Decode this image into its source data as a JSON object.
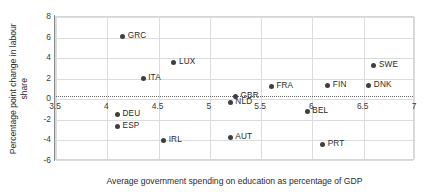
{
  "chart_data": {
    "type": "scatter",
    "title": "",
    "xlabel": "Average government spending on education as percentage of GDP",
    "ylabel": "Percentage point change in labour share",
    "xlim": [
      3.5,
      7
    ],
    "ylim": [
      -6,
      8
    ],
    "xticks": [
      "3.5",
      "4",
      "4.5",
      "5",
      "5.5",
      "6",
      "6.5",
      "7"
    ],
    "xtick_values": [
      3.5,
      4,
      4.5,
      5,
      5.5,
      6,
      6.5,
      7
    ],
    "yticks": [
      "8",
      "6",
      "4",
      "2",
      "0",
      "-2",
      "-4",
      "-6"
    ],
    "ytick_values": [
      8,
      6,
      4,
      2,
      0,
      -2,
      -4,
      -6
    ],
    "grid": true,
    "legend": "none",
    "point_color": "#3f3f3f",
    "trendline": {
      "style": "dotted",
      "color": "#6a6a6a",
      "y_value": 0.35,
      "description": "near-horizontal dotted fit line just above zero"
    },
    "points": [
      {
        "label": "GRC",
        "x": 4.15,
        "y": 6.1
      },
      {
        "label": "LUX",
        "x": 4.65,
        "y": 3.6
      },
      {
        "label": "SWE",
        "x": 6.6,
        "y": 3.3
      },
      {
        "label": "ITA",
        "x": 4.35,
        "y": 2.0
      },
      {
        "label": "FIN",
        "x": 6.15,
        "y": 1.3
      },
      {
        "label": "DNK",
        "x": 6.55,
        "y": 1.3
      },
      {
        "label": "FRA",
        "x": 5.6,
        "y": 1.2
      },
      {
        "label": "GBR",
        "x": 5.25,
        "y": 0.3
      },
      {
        "label": "NLD",
        "x": 5.2,
        "y": -0.3
      },
      {
        "label": "BEL",
        "x": 5.95,
        "y": -1.2
      },
      {
        "label": "DEU",
        "x": 4.1,
        "y": -1.5
      },
      {
        "label": "ESP",
        "x": 4.1,
        "y": -2.6
      },
      {
        "label": "AUT",
        "x": 5.2,
        "y": -3.7
      },
      {
        "label": "IRL",
        "x": 4.55,
        "y": -4.0
      },
      {
        "label": "PRT",
        "x": 6.1,
        "y": -4.4
      }
    ]
  }
}
